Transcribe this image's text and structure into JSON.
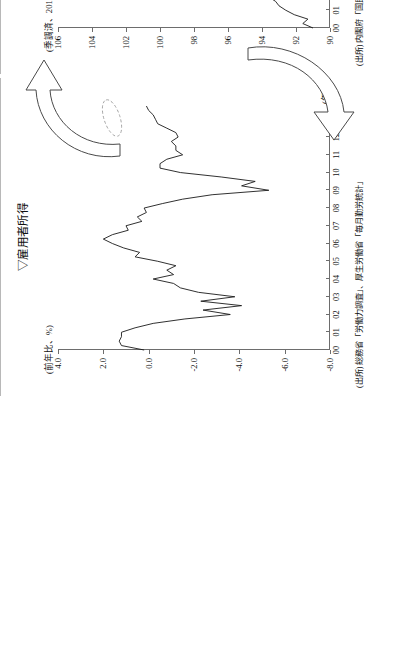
{
  "charts": [
    {
      "id": "employment",
      "title": "▽雇用者所得",
      "unit_label": "(前年比、%)",
      "x_unit": "(年)",
      "source": "(出所) 総務省「労働力調査」、厚生労働省「毎月勤労統計」",
      "chart_data": {
        "type": "line",
        "title": "▽雇用者所得",
        "ylabel": "(前年比、%)",
        "xlabel": "(年)",
        "ylim": [
          -8.0,
          4.0
        ],
        "ytick_labels": [
          "4.0",
          "2.0",
          "0.0",
          "-2.0",
          "-4.0",
          "-6.0",
          "-8.0"
        ],
        "ytick_values": [
          4.0,
          2.0,
          0.0,
          -2.0,
          -4.0,
          -6.0,
          -8.0
        ],
        "xtick_labels": [
          "00",
          "01",
          "02",
          "03",
          "04",
          "05",
          "06",
          "07",
          "08",
          "09",
          "10",
          "11",
          "12",
          "13"
        ],
        "xlim": [
          2000,
          2013.75
        ],
        "grid": false,
        "legend": "none",
        "annotation": "circled region at right end (2013)",
        "x": [
          2000.0,
          2000.25,
          2000.5,
          2000.75,
          2001.0,
          2001.25,
          2001.5,
          2001.75,
          2002.0,
          2002.25,
          2002.5,
          2002.75,
          2003.0,
          2003.25,
          2003.5,
          2003.75,
          2004.0,
          2004.25,
          2004.5,
          2004.75,
          2005.0,
          2005.25,
          2005.5,
          2005.75,
          2006.0,
          2006.25,
          2006.5,
          2006.75,
          2007.0,
          2007.25,
          2007.5,
          2007.75,
          2008.0,
          2008.25,
          2008.5,
          2008.75,
          2009.0,
          2009.25,
          2009.5,
          2009.75,
          2010.0,
          2010.25,
          2010.5,
          2010.75,
          2011.0,
          2011.25,
          2011.5,
          2011.75,
          2012.0,
          2012.25,
          2012.5,
          2012.75,
          2013.0,
          2013.25,
          2013.5,
          2013.75
        ],
        "values": [
          0.2,
          1.2,
          1.3,
          1.2,
          1.2,
          0.6,
          -0.2,
          -1.6,
          -3.6,
          -2.4,
          -4.1,
          -2.3,
          -3.8,
          -2.2,
          -1.4,
          -1.1,
          -0.2,
          -1.1,
          -0.8,
          -1.2,
          -0.4,
          0.6,
          0.4,
          1.1,
          1.6,
          2.0,
          1.6,
          0.9,
          1.0,
          0.3,
          0.5,
          0.1,
          0.2,
          -0.6,
          -1.5,
          -2.8,
          -5.3,
          -4.1,
          -4.7,
          -3.2,
          -1.4,
          -0.5,
          -0.5,
          -0.8,
          -1.5,
          -1.2,
          -1.2,
          -1.0,
          -1.3,
          -1.2,
          -0.8,
          -0.4,
          -0.3,
          -0.2,
          0.0,
          0.1
        ]
      }
    },
    {
      "id": "consumption",
      "title": "▽民間最終消費支出",
      "unit_label": "(季調済、2010年=100)",
      "x_unit": "(年)",
      "source": "(出所) 内閣府「国民経済計算」",
      "chart_data": {
        "type": "line",
        "title": "▽民間最終消費支出",
        "ylabel": "(季調済、2010年=100)",
        "xlabel": "(年)",
        "ylim": [
          90,
          106
        ],
        "ytick_labels": [
          "106",
          "104",
          "102",
          "100",
          "98",
          "96",
          "94",
          "92",
          "90"
        ],
        "ytick_values": [
          106,
          104,
          102,
          100,
          98,
          96,
          94,
          92,
          90
        ],
        "xtick_labels": [
          "00",
          "01",
          "02",
          "03",
          "04",
          "05",
          "06",
          "07",
          "08",
          "09",
          "10",
          "11",
          "12",
          "13"
        ],
        "xlim": [
          2000,
          2013.75
        ],
        "grid": false,
        "legend": "none",
        "annotation": "circled region at right end (2013)",
        "x": [
          2000.0,
          2000.25,
          2000.5,
          2000.75,
          2001.0,
          2001.25,
          2001.5,
          2001.75,
          2002.0,
          2002.25,
          2002.5,
          2002.75,
          2003.0,
          2003.25,
          2003.5,
          2003.75,
          2004.0,
          2004.25,
          2004.5,
          2004.75,
          2005.0,
          2005.25,
          2005.5,
          2005.75,
          2006.0,
          2006.25,
          2006.5,
          2006.75,
          2007.0,
          2007.25,
          2007.5,
          2007.75,
          2008.0,
          2008.25,
          2008.5,
          2008.75,
          2009.0,
          2009.25,
          2009.5,
          2009.75,
          2010.0,
          2010.25,
          2010.5,
          2010.75,
          2011.0,
          2011.25,
          2011.5,
          2011.75,
          2012.0,
          2012.25,
          2012.5,
          2012.75,
          2013.0,
          2013.25,
          2013.5,
          2013.75
        ],
        "values": [
          91.0,
          91.6,
          91.3,
          92.1,
          92.6,
          93.0,
          93.2,
          93.6,
          93.8,
          94.2,
          94.3,
          94.7,
          94.8,
          95.3,
          95.4,
          95.6,
          96.0,
          96.2,
          96.6,
          96.8,
          97.2,
          97.5,
          97.8,
          98.0,
          98.2,
          98.3,
          98.6,
          98.8,
          99.2,
          99.4,
          99.6,
          99.7,
          99.4,
          99.2,
          98.8,
          98.1,
          97.8,
          98.4,
          98.9,
          99.4,
          99.8,
          100.0,
          100.2,
          100.4,
          99.8,
          100.2,
          100.6,
          100.9,
          101.4,
          101.8,
          102.0,
          102.4,
          103.0,
          103.6,
          104.4,
          105.1
        ]
      }
    }
  ],
  "decorations": {
    "arrow_upper_name": "curved-arrow-to-consumption",
    "arrow_lower_name": "curved-arrow-to-employment"
  }
}
